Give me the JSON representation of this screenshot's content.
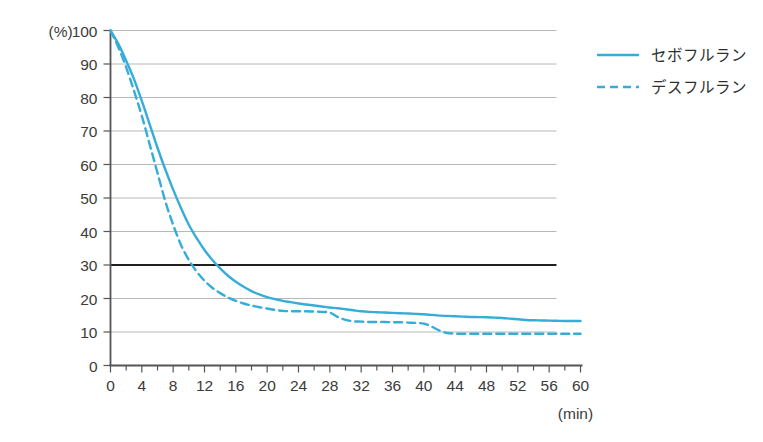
{
  "chart_data": {
    "type": "line",
    "title": "",
    "subtitle": "",
    "xlabel": "(min)",
    "ylabel": "(%)",
    "xlim": [
      0,
      60
    ],
    "ylim": [
      0,
      100
    ],
    "grid": true,
    "legend_position": "top-right",
    "x_tick_labels": [
      "0",
      "4",
      "8",
      "12",
      "16",
      "20",
      "24",
      "28",
      "32",
      "36",
      "40",
      "44",
      "48",
      "52",
      "56",
      "60"
    ],
    "x_ticks": [
      0,
      4,
      8,
      12,
      16,
      20,
      24,
      28,
      32,
      36,
      40,
      44,
      48,
      52,
      56,
      60
    ],
    "x_minor_tick_step": 2,
    "y_tick_labels": [
      "0",
      "10",
      "20",
      "30",
      "40",
      "50",
      "60",
      "70",
      "80",
      "90",
      "100"
    ],
    "y_ticks": [
      0,
      10,
      20,
      30,
      40,
      50,
      60,
      70,
      80,
      90,
      100
    ],
    "emphasis_line_y": 30,
    "emphasis_line_color": "#231f20",
    "grid_color": "#b8b8b8",
    "axis_color": "#555555",
    "series_color": "#35add8",
    "x": [
      0,
      1,
      2,
      3,
      4,
      5,
      6,
      7,
      8,
      9,
      10,
      11,
      12,
      13,
      14,
      15,
      16,
      17,
      18,
      19,
      20,
      21,
      22,
      23,
      24,
      25,
      26,
      27,
      28,
      29,
      30,
      31,
      32,
      33,
      34,
      35,
      36,
      37,
      38,
      39,
      40,
      41,
      42,
      43,
      44,
      45,
      46,
      47,
      48,
      49,
      50,
      51,
      52,
      53,
      54,
      55,
      56,
      57,
      58,
      59,
      60
    ],
    "series": [
      {
        "name": "セボフルラン",
        "style": "solid",
        "color": "#35add8",
        "values": [
          100,
          96,
          91,
          85.5,
          79,
          72,
          65,
          58.5,
          52.5,
          47,
          42,
          38,
          34.5,
          31.5,
          29,
          26.8,
          25,
          23.5,
          22.2,
          21.2,
          20.4,
          19.8,
          19.3,
          18.9,
          18.5,
          18.2,
          17.9,
          17.6,
          17.3,
          17.1,
          16.8,
          16.5,
          16.2,
          16.0,
          15.9,
          15.8,
          15.7,
          15.6,
          15.5,
          15.4,
          15.3,
          15.1,
          14.9,
          14.8,
          14.7,
          14.6,
          14.5,
          14.45,
          14.4,
          14.3,
          14.2,
          14.0,
          13.8,
          13.6,
          13.5,
          13.45,
          13.4,
          13.35,
          13.3,
          13.3,
          13.3
        ]
      },
      {
        "name": "デスフルラン",
        "style": "dashed",
        "color": "#35add8",
        "values": [
          100,
          95,
          89,
          82,
          74.5,
          66,
          57.5,
          49,
          42,
          36,
          31.5,
          28,
          25.3,
          23.2,
          21.6,
          20.3,
          19.3,
          18.5,
          17.9,
          17.4,
          17.0,
          16.6,
          16.3,
          16.2,
          16.2,
          16.2,
          16.1,
          16.0,
          15.8,
          14.5,
          13.6,
          13.2,
          13.1,
          13.0,
          13.0,
          13.0,
          12.9,
          12.9,
          12.8,
          12.7,
          12.5,
          11.6,
          10.4,
          9.7,
          9.5,
          9.5,
          9.5,
          9.5,
          9.5,
          9.5,
          9.5,
          9.5,
          9.5,
          9.5,
          9.5,
          9.5,
          9.5,
          9.5,
          9.5,
          9.5,
          9.5
        ]
      }
    ]
  },
  "legend": {
    "items": [
      {
        "label": "セボフルラン",
        "style": "solid"
      },
      {
        "label": "デスフルラン",
        "style": "dashed"
      }
    ]
  },
  "axes": {
    "y_unit": "(%)",
    "x_unit": "(min)"
  }
}
